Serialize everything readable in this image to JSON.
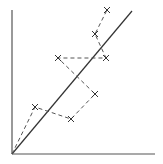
{
  "chart_data": {
    "type": "line",
    "title": "",
    "xlabel": "",
    "ylabel": "",
    "grid": false,
    "legend": null,
    "xlim": [
      0,
      10
    ],
    "ylim": [
      0,
      10
    ],
    "series": [
      {
        "name": "reference-diagonal",
        "style": "solid",
        "color": "#333333",
        "x": [
          0,
          8.4
        ],
        "y": [
          0,
          10
        ]
      },
      {
        "name": "observed-path",
        "style": "dashed",
        "marker": "x",
        "color": "#444444",
        "x": [
          0,
          1.6,
          4.1,
          5.8,
          3.2,
          6.5,
          5.8,
          6.6
        ],
        "y": [
          0,
          3.3,
          2.4,
          4.2,
          6.7,
          6.7,
          8.4,
          10.0
        ]
      }
    ]
  },
  "plot": {
    "axis_color": "#555555",
    "line_color": "#333333",
    "dash_color": "#555555",
    "origin_px": [
      12,
      154
    ],
    "axis_end_x_px": 155,
    "axis_end_y_px": 10,
    "diagonal_end_px": [
      132,
      11
    ],
    "points_px": [
      [
        35,
        107
      ],
      [
        71,
        119
      ],
      [
        95,
        94
      ],
      [
        58,
        58
      ],
      [
        106,
        58
      ],
      [
        95,
        34
      ],
      [
        107,
        10
      ]
    ]
  }
}
